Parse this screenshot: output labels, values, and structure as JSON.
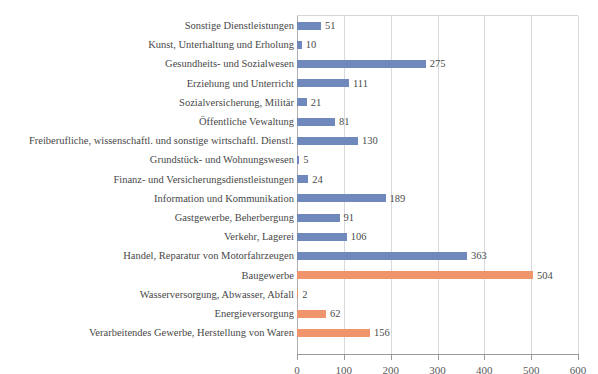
{
  "chart_data": {
    "type": "bar",
    "orientation": "horizontal",
    "title": "",
    "xlabel": "",
    "ylabel": "",
    "xlim": [
      0,
      600
    ],
    "xticks": [
      0,
      100,
      200,
      300,
      400,
      500,
      600
    ],
    "xtick_labels": [
      "0",
      "100",
      "200",
      "300",
      "400",
      "500",
      "600"
    ],
    "grid": "vertical",
    "legend": "none",
    "colors": {
      "series_blue": "#7089BD",
      "series_orange": "#F0956B",
      "gridline": "#d9d9dd",
      "axis": "#9a9a9e",
      "text": "#4a4a4a"
    },
    "categories": [
      "Sonstige Dienstleistungen",
      "Kunst, Unterhaltung und Erholung",
      "Gesundheits- und Sozialwesen",
      "Erziehung und Unterricht",
      "Sozialversicherung, Militär",
      "Öffentliche Vewaltung",
      "Freiberufliche, wissenschaftl. und sonstige wirtschaftl. Dienstl.",
      "Grundstück- und Wohnungswesen",
      "Finanz- und Versicherungsdienstleistungen",
      "Information und Kommunikation",
      "Gastgewerbe, Beherbergung",
      "Verkehr, Lagerei",
      "Handel, Reparatur von Motorfahrzeugen",
      "Baugewerbe",
      "Wasserversorgung, Abwasser, Abfall",
      "Energieversorgung",
      "Verarbeitendes Gewerbe, Herstellung von Waren"
    ],
    "values": [
      51,
      10,
      275,
      111,
      21,
      81,
      130,
      5,
      24,
      189,
      91,
      106,
      363,
      504,
      2,
      62,
      156
    ],
    "value_labels": [
      "51",
      "10",
      "275",
      "111",
      "21",
      "81",
      "130",
      "5",
      "24",
      "189",
      "91",
      "106",
      "363",
      "504",
      "2",
      "62",
      "156"
    ],
    "bar_colors": [
      "blue",
      "blue",
      "blue",
      "blue",
      "blue",
      "blue",
      "blue",
      "blue",
      "blue",
      "blue",
      "blue",
      "blue",
      "blue",
      "orange",
      "orange",
      "orange",
      "orange"
    ]
  },
  "top_sliver": {
    "text": ""
  }
}
